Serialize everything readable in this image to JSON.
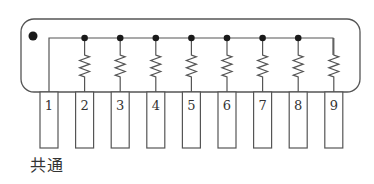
{
  "diagram": {
    "pins": [
      {
        "label": "1",
        "role": "common"
      },
      {
        "label": "2"
      },
      {
        "label": "3"
      },
      {
        "label": "4"
      },
      {
        "label": "5"
      },
      {
        "label": "6"
      },
      {
        "label": "7"
      },
      {
        "label": "8"
      },
      {
        "label": "9"
      }
    ],
    "resistor_count": 8,
    "common_label": "共通",
    "colors": {
      "stroke": "#444444",
      "dot": "#1a1a1a",
      "background": "#ffffff"
    }
  }
}
